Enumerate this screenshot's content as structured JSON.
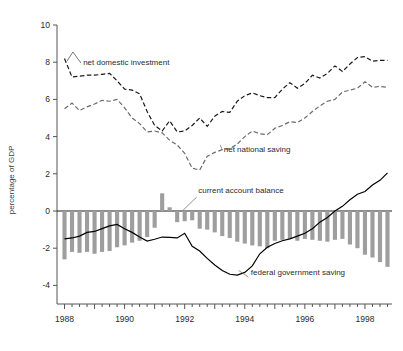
{
  "chart_data": {
    "type": "line",
    "title": "",
    "xlabel": "",
    "ylabel": "percentage of GDP",
    "ylim": [
      -5,
      10
    ],
    "xlim": [
      1987.75,
      1998.9
    ],
    "grid": false,
    "legend_position": "inline-annotations",
    "yticks": [
      10,
      8,
      6,
      4,
      2,
      0,
      -2,
      -4
    ],
    "ytick_labels": [
      "10",
      "8",
      "6",
      "4",
      "2",
      "0",
      "-2",
      "-4"
    ],
    "xticks": [
      1988,
      1990,
      1992,
      1994,
      1996,
      1998
    ],
    "xtick_labels": [
      "1988",
      "1990",
      "1992",
      "1994",
      "1996",
      "1998"
    ],
    "x_minor_interval_quarters": 1,
    "x": [
      1988.0,
      1988.25,
      1988.5,
      1988.75,
      1989.0,
      1989.25,
      1989.5,
      1989.75,
      1990.0,
      1990.25,
      1990.5,
      1990.75,
      1991.0,
      1991.25,
      1991.5,
      1991.75,
      1992.0,
      1992.25,
      1992.5,
      1992.75,
      1993.0,
      1993.25,
      1993.5,
      1993.75,
      1994.0,
      1994.25,
      1994.5,
      1994.75,
      1995.0,
      1995.25,
      1995.5,
      1995.75,
      1996.0,
      1996.25,
      1996.5,
      1996.75,
      1997.0,
      1997.25,
      1997.5,
      1997.75,
      1998.0,
      1998.25,
      1998.5,
      1998.75
    ],
    "series": [
      {
        "name": "net domestic investment",
        "style": "dashed",
        "color": "#1a1a1a",
        "label_x": 1988.55,
        "label_y": 8.05,
        "values": [
          8.2,
          7.2,
          7.25,
          7.3,
          7.3,
          7.35,
          7.4,
          7.0,
          6.55,
          6.5,
          6.3,
          5.35,
          4.6,
          4.3,
          4.85,
          4.25,
          4.3,
          4.6,
          5.0,
          4.55,
          5.1,
          5.35,
          5.3,
          5.9,
          6.2,
          6.35,
          6.2,
          6.1,
          6.1,
          6.55,
          6.9,
          6.6,
          6.85,
          7.3,
          7.15,
          7.4,
          7.8,
          7.5,
          7.9,
          8.25,
          8.3,
          8.05,
          8.1,
          8.1
        ]
      },
      {
        "name": "net national saving",
        "style": "dashed",
        "color": "#6b6b6b",
        "label_x": 1993.2,
        "label_y": 3.25,
        "values": [
          5.5,
          5.8,
          5.4,
          5.6,
          5.75,
          5.95,
          5.9,
          6.0,
          5.55,
          5.0,
          4.7,
          4.25,
          4.3,
          4.2,
          3.8,
          3.55,
          3.1,
          2.3,
          2.2,
          2.95,
          3.15,
          3.3,
          3.35,
          3.6,
          4.0,
          4.3,
          4.15,
          4.1,
          4.45,
          4.6,
          4.8,
          4.75,
          5.0,
          5.35,
          5.65,
          5.9,
          6.0,
          6.4,
          6.5,
          6.6,
          6.95,
          6.65,
          6.7,
          6.65
        ]
      },
      {
        "name": "federal government saving",
        "style": "solid",
        "color": "#000000",
        "label_x": 1994.05,
        "label_y": -3.6,
        "values": [
          -1.5,
          -1.45,
          -1.35,
          -1.15,
          -1.1,
          -0.95,
          -0.8,
          -0.72,
          -0.95,
          -1.15,
          -1.4,
          -1.62,
          -1.52,
          -1.4,
          -1.42,
          -1.45,
          -1.2,
          -1.9,
          -2.15,
          -2.55,
          -2.9,
          -3.2,
          -3.4,
          -3.45,
          -3.3,
          -2.95,
          -2.3,
          -1.95,
          -1.75,
          -1.6,
          -1.5,
          -1.35,
          -1.2,
          -0.95,
          -0.6,
          -0.35,
          0.0,
          0.25,
          0.6,
          0.9,
          1.05,
          1.4,
          1.65,
          2.05
        ]
      },
      {
        "name": "current account balance",
        "style": "bars",
        "color": "#9e9e9e",
        "label_x": 1992.35,
        "label_y": 0.85,
        "values": [
          -2.6,
          -2.2,
          -2.25,
          -2.2,
          -2.3,
          -2.2,
          -2.15,
          -1.95,
          -1.85,
          -1.7,
          -1.6,
          -1.4,
          -0.9,
          0.95,
          0.2,
          -0.6,
          -0.55,
          -0.5,
          -0.95,
          -1.0,
          -1.15,
          -1.35,
          -1.45,
          -1.65,
          -1.75,
          -1.85,
          -1.9,
          -2.0,
          -1.6,
          -1.55,
          -1.5,
          -1.6,
          -1.5,
          -1.55,
          -1.6,
          -1.65,
          -1.55,
          -1.5,
          -1.8,
          -2.0,
          -2.35,
          -2.5,
          -2.75,
          -3.0
        ]
      }
    ]
  },
  "annotations": {
    "net_domestic_investment": "net domestic investment",
    "net_national_saving": "net national saving",
    "current_account_balance": "current account balance",
    "federal_government_saving": "federal government saving",
    "y_axis_title": "percentage of GDP"
  },
  "colors": {
    "bar": "#9e9e9e",
    "investment_line": "#1a1a1a",
    "saving_line": "#6b6b6b",
    "federal_line": "#000000",
    "axis": "#555555",
    "text": "#2b2b2b",
    "background": "#ffffff"
  }
}
